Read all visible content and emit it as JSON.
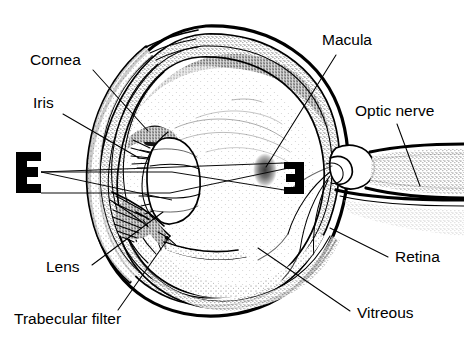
{
  "figure": {
    "background_color": "#ffffff",
    "ink_color": "#000000",
    "width": 464,
    "height": 349
  },
  "labels": [
    {
      "id": "cornea",
      "text": "Cornea",
      "x": 30,
      "y": 65,
      "anchor": "start"
    },
    {
      "id": "iris",
      "text": "Iris",
      "x": 33,
      "y": 108,
      "anchor": "start"
    },
    {
      "id": "lens",
      "text": "Lens",
      "x": 46,
      "y": 272,
      "anchor": "start"
    },
    {
      "id": "trabecular-filter",
      "text": "Trabecular filter",
      "x": 14,
      "y": 324,
      "anchor": "start"
    },
    {
      "id": "macula",
      "text": "Macula",
      "x": 322,
      "y": 45,
      "anchor": "start"
    },
    {
      "id": "optic-nerve",
      "text": "Optic nerve",
      "x": 355,
      "y": 116,
      "anchor": "start"
    },
    {
      "id": "retina",
      "text": "Retina",
      "x": 395,
      "y": 262,
      "anchor": "start"
    },
    {
      "id": "vitreous",
      "text": "Vitreous",
      "x": 357,
      "y": 318,
      "anchor": "start"
    }
  ],
  "optotypes": [
    {
      "id": "object-letter-e",
      "letter": "E",
      "orientation": "normal",
      "role": "object viewed",
      "x": 16,
      "y": 152,
      "width": 25,
      "height": 41
    },
    {
      "id": "retinal-image-letter-e",
      "letter": "E",
      "orientation": "mirrored-inverted",
      "role": "inverted retinal image",
      "x": 284,
      "y": 162,
      "width": 20,
      "height": 31
    }
  ],
  "structures": [
    {
      "id": "cornea",
      "name": "Cornea"
    },
    {
      "id": "iris",
      "name": "Iris"
    },
    {
      "id": "lens",
      "name": "Lens"
    },
    {
      "id": "trabecular-filter",
      "name": "Trabecular filter"
    },
    {
      "id": "macula",
      "name": "Macula"
    },
    {
      "id": "optic-nerve",
      "name": "Optic nerve"
    },
    {
      "id": "retina",
      "name": "Retina"
    },
    {
      "id": "vitreous",
      "name": "Vitreous"
    },
    {
      "id": "sclera",
      "name": "Sclera"
    },
    {
      "id": "choroid",
      "name": "Choroid"
    }
  ],
  "light_rays": {
    "description": "Two straight rays from the top and bottom of the object E crossing at the lens and forming the inverted image on the retina",
    "count": 2
  }
}
